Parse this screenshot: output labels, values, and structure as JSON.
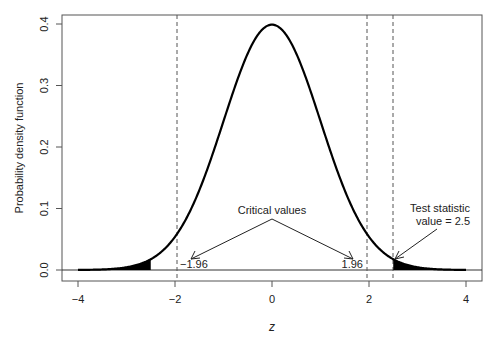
{
  "chart_data": {
    "type": "line",
    "title": "",
    "xlabel": "z",
    "ylabel": "Probability density function",
    "xlim": [
      -4,
      4
    ],
    "ylim": [
      0.0,
      0.4
    ],
    "x_ticks": [
      "-4",
      "-2",
      "0",
      "2",
      "4"
    ],
    "y_ticks": [
      "0.0",
      "0.1",
      "0.2",
      "0.3",
      "0.4"
    ],
    "grid": false,
    "legend": null,
    "series": [
      {
        "name": "Standard normal density",
        "function": "N(0,1) pdf",
        "peak": {
          "x": 0,
          "y": 0.399
        }
      }
    ],
    "shaded_regions": [
      {
        "from": -4,
        "to": -2.5,
        "fill": "#000000"
      },
      {
        "from": 2.5,
        "to": 4,
        "fill": "#000000"
      }
    ],
    "vertical_lines": [
      {
        "x": -1.96,
        "style": "dashed"
      },
      {
        "x": 1.96,
        "style": "dashed"
      },
      {
        "x": 2.5,
        "style": "dashed"
      }
    ],
    "annotations": [
      {
        "text": "Critical values",
        "x": 0,
        "y": 0.095,
        "arrows_to": [
          [
            -1.65,
            0.018
          ],
          [
            1.7,
            0.018
          ]
        ]
      },
      {
        "text": "-1.96",
        "x": -1.96,
        "y": 0.01
      },
      {
        "text": "1.96",
        "x": 1.96,
        "y": 0.01
      },
      {
        "text": "Test statistic",
        "x": 3.2,
        "y": 0.06
      },
      {
        "text": "value = 2.5",
        "x": 3.2,
        "y": 0.04,
        "arrow_to": [
          2.5,
          0.0175
        ]
      }
    ]
  },
  "labels": {
    "critical_values": "Critical values",
    "neg_critical": "−1.96",
    "pos_critical": "1.96",
    "test_stat_line1": "Test statistic",
    "test_stat_line2": "value = 2.5",
    "xlabel": "z",
    "ylabel": "Probability density function",
    "xticks": [
      "−4",
      "−2",
      "0",
      "2",
      "4"
    ],
    "yticks": [
      "0.0",
      "0.1",
      "0.2",
      "0.3",
      "0.4"
    ]
  }
}
